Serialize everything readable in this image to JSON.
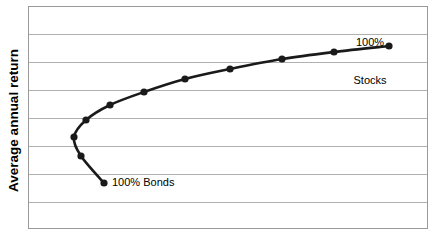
{
  "chart_data": {
    "type": "line",
    "title": "",
    "xlabel": "",
    "ylabel": "Average annual return",
    "grid": true,
    "gridlines_count": 8,
    "legend": "none",
    "axis_tick_labels": [],
    "annotations": [
      {
        "name": "stocks-endpoint-label",
        "line1": "100%",
        "line2": "Stocks",
        "text": "100% Stocks"
      },
      {
        "name": "bonds-endpoint-label",
        "line1": "100% Bonds",
        "line2": "",
        "text": "100% Bonds"
      }
    ],
    "series": [
      {
        "name": "Efficient frontier",
        "marker": "filled-circle",
        "color": "#1a1a1a",
        "points": [
          {
            "x": 104,
            "y": 183,
            "label": "100% Bonds"
          },
          {
            "x": 81,
            "y": 156,
            "label": ""
          },
          {
            "x": 74,
            "y": 137,
            "label": ""
          },
          {
            "x": 86,
            "y": 120,
            "label": ""
          },
          {
            "x": 110,
            "y": 105,
            "label": ""
          },
          {
            "x": 144,
            "y": 92,
            "label": ""
          },
          {
            "x": 185,
            "y": 79,
            "label": ""
          },
          {
            "x": 230,
            "y": 69,
            "label": ""
          },
          {
            "x": 282,
            "y": 59,
            "label": ""
          },
          {
            "x": 334,
            "y": 52,
            "label": ""
          },
          {
            "x": 389,
            "y": 46,
            "label": "100% Stocks"
          }
        ]
      }
    ]
  },
  "plot": {
    "frame_color": "#9a9a9a",
    "grid_color": "#b0b0b0",
    "background": "#ffffff",
    "left": 28,
    "top": 6,
    "width": 400,
    "height": 223,
    "gridline_y": [
      34,
      62,
      90,
      118,
      146,
      174,
      202
    ]
  },
  "axis": {
    "y_label": "Average annual return"
  }
}
